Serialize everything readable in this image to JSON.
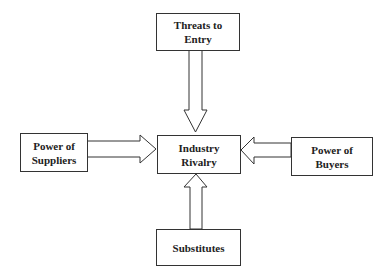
{
  "diagram": {
    "title": "",
    "nodes": [
      {
        "id": "threats",
        "label": "Threats to\nEntry"
      },
      {
        "id": "suppliers",
        "label": "Power of\nSuppliers"
      },
      {
        "id": "rivalry",
        "label": "Industry\nRivalry"
      },
      {
        "id": "buyers",
        "label": "Power of\nBuyers"
      },
      {
        "id": "substitutes",
        "label": "Substitutes"
      }
    ],
    "edges": [
      {
        "from": "threats",
        "to": "rivalry",
        "style": "block-arrow"
      },
      {
        "from": "suppliers",
        "to": "rivalry",
        "style": "block-arrow"
      },
      {
        "from": "buyers",
        "to": "rivalry",
        "style": "block-arrow"
      },
      {
        "from": "substitutes",
        "to": "rivalry",
        "style": "block-arrow"
      }
    ],
    "colors": {
      "stroke": "#333333",
      "fill": "#ffffff",
      "text": "#222222"
    }
  }
}
